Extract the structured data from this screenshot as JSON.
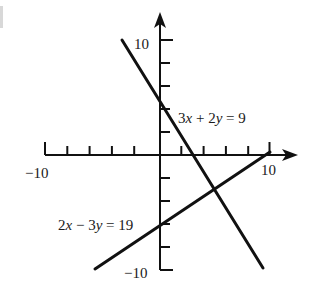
{
  "figure": {
    "type": "coordinate-plane",
    "x_axis": {
      "min_label": "−10",
      "max_label": "10",
      "tick_step": 2,
      "range": [
        -10,
        10
      ]
    },
    "y_axis": {
      "min_label": "−10",
      "max_label": "10",
      "tick_step": 2,
      "range": [
        -10,
        10
      ]
    },
    "lines": [
      {
        "equation": "3x + 2y = 9",
        "parts": [
          "3",
          "x",
          " + 2",
          "y",
          " = 9"
        ],
        "color": "#111111"
      },
      {
        "equation": "2x − 3y = 19",
        "parts": [
          "2",
          "x",
          " − 3",
          "y",
          " = 19"
        ],
        "color": "#111111"
      }
    ],
    "intersection_estimate": {
      "x": 5,
      "y": -3
    }
  },
  "labels": {
    "x_min": "−10",
    "x_max": "10",
    "y_max": "10",
    "y_min": "−10"
  }
}
